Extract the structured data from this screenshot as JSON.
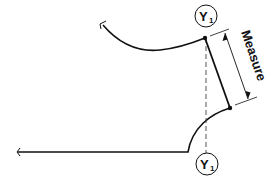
{
  "diagram": {
    "title": "",
    "labels": {
      "top_marker": "Y",
      "top_marker_sub": "1",
      "bottom_marker": "Y",
      "bottom_marker_sub": "1",
      "dimension": "Measure"
    },
    "colors": {
      "line": "#111111",
      "background": "#ffffff"
    }
  }
}
